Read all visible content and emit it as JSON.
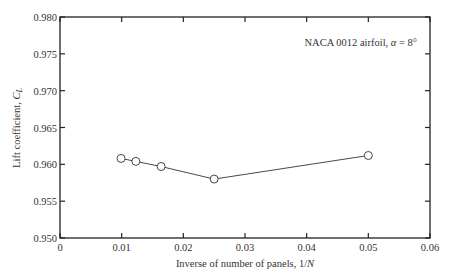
{
  "chart_data": {
    "type": "line",
    "title": "",
    "annotation": "NACA 0012 airfoil, α = 8°",
    "xlabel": "Inverse of number of panels, 1/N",
    "ylabel": "Lift coefficient, C_L",
    "xlim": [
      0,
      0.06
    ],
    "ylim": [
      0.95,
      0.98
    ],
    "x_ticks": [
      "0",
      "0.01",
      "0.02",
      "0.03",
      "0.04",
      "0.05",
      "0.06"
    ],
    "y_ticks": [
      "0.950",
      "0.955",
      "0.960",
      "0.965",
      "0.970",
      "0.975",
      "0.980"
    ],
    "grid": false,
    "legend": null,
    "series": [
      {
        "name": "C_L vs 1/N",
        "marker": "open-circle",
        "x": [
          0.0099,
          0.0123,
          0.0164,
          0.025,
          0.05
        ],
        "y": [
          0.9608,
          0.9604,
          0.9597,
          0.958,
          0.9612
        ]
      }
    ]
  },
  "labels": {
    "annotation_prefix": "NACA 0012 airfoil, ",
    "annotation_alpha": "α",
    "annotation_suffix": " = 8°",
    "xlabel_main": "Inverse of number of panels, 1/",
    "xlabel_var": "N",
    "ylabel_main": "Lift coefficient, ",
    "ylabel_var": "C",
    "ylabel_sub": "L"
  }
}
